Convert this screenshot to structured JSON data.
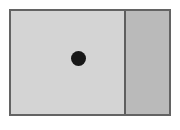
{
  "figure": {
    "name": "two-panel-shaded-rectangle-with-point",
    "caption": "",
    "background_color": "#ffffff",
    "frame": {
      "border_color": "#636363",
      "border_width_px": 2,
      "x_px": 9,
      "y_px": 9,
      "width_px": 162,
      "height_px": 107
    },
    "panels": [
      {
        "id": "left-panel",
        "label": "",
        "fill_color": "#d4d4d4",
        "width_px": 113,
        "shade": "light"
      },
      {
        "id": "right-panel",
        "label": "",
        "fill_color": "#bababa",
        "width_px": 45,
        "shade": "dark"
      }
    ],
    "divider": {
      "id": "panel-divider",
      "orientation": "vertical",
      "color": "#5e5e5e",
      "width_px": 2,
      "x_px": 124
    },
    "marker": {
      "id": "center-dot",
      "shape": "filled-circle",
      "color": "#171717",
      "diameter_px": 15,
      "center_x_px": 78,
      "center_y_px": 58
    }
  }
}
